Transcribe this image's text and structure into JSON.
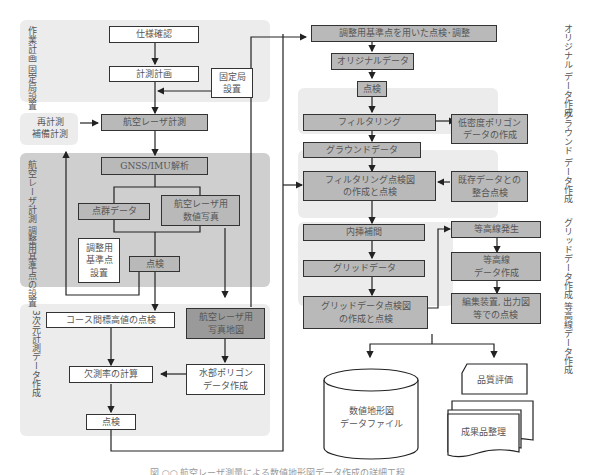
{
  "diagram": {
    "type": "flowchart",
    "language": "ja",
    "sections": {
      "work_plan": "作業計画\n固定局設置",
      "re_survey": "再計測\n補備計測",
      "laser_survey": "航空レーザ計測\n調整用基準点の設置",
      "data_3d": "3次元計測データ作成",
      "original_data": "オリジナル\nデータ作成",
      "ground_data": "グラウンド\nデータ作成",
      "grid_contour": "グリッドデータ作成\n等高線データ作成"
    },
    "nodes": {
      "spec_confirm": "仕様確認",
      "survey_plan": "計測計画",
      "fixed_station": "固定局\n設置",
      "laser_measure": "航空レーザ計測",
      "gnss_imu": "GNSS/IMU解析",
      "point_cloud": "点群データ",
      "laser_photo": "航空レーザ用\n数値写真",
      "adj_ref_point": "調整用\n基準点\n設置",
      "inspect1": "点検",
      "course_check": "コース間標高値の点検",
      "laser_photomap": "航空レーザ用\n写真地図",
      "missing_rate": "欠測率の計算",
      "water_polygon": "水部ポリゴン\nデータ作成",
      "inspect2": "点検",
      "adj_check": "調整用基準点を用いた点検･調整",
      "original_data": "オリジナルデータ",
      "inspect3": "点検",
      "filtering": "フィルタリング",
      "low_density": "低密度ポリゴン\nデータの作成",
      "ground_data": "グラウンドデータ",
      "filter_check": "フィルタリング点検図\nの作成と点検",
      "existing_data": "既存データとの\n整合点検",
      "interpolation": "内挿補間",
      "grid_data": "グリッドデータ",
      "grid_check": "グリッドデータ点検図\nの作成と点検",
      "contour_gen": "等高線発生",
      "contour_data": "等高線\nデータ作成",
      "editor_check": "編集装置, 出力図\n等での点検",
      "dem_file": "数値地形図\nデータファイル",
      "quality_eval": "品質評価",
      "deliverables": "成果品整理"
    },
    "caption": "図 ○○  航空レーザ測量による数値地形図データ作成の詳細工程"
  }
}
